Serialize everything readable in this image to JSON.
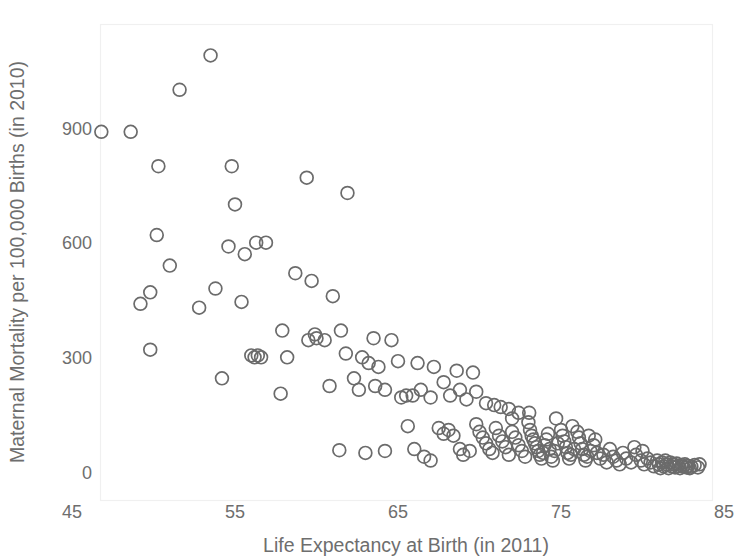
{
  "chart_data": {
    "type": "scatter",
    "title": "",
    "xlabel": "Life Expectancy at Birth (in 2011)",
    "ylabel": "Maternal Mortality per 100,000 Births (in 2010)",
    "xlim": [
      45,
      85
    ],
    "ylim": [
      -40,
      1180
    ],
    "xticks": [
      45,
      55,
      65,
      75,
      85
    ],
    "yticks": [
      0,
      300,
      600,
      900
    ],
    "xticklabels": [
      "45",
      "55",
      "65",
      "75",
      "85"
    ],
    "yticklabels": [
      "0",
      "300",
      "600",
      "900"
    ],
    "grid": false,
    "legend": null,
    "marker": {
      "shape": "open-circle",
      "radius_px": 6.4,
      "stroke": "#6b6b6b",
      "fill": "none",
      "stroke_width": 1.7
    },
    "n_points": 178,
    "points": [
      [
        53.5,
        1090
      ],
      [
        51.6,
        1000
      ],
      [
        46.8,
        890
      ],
      [
        48.6,
        890
      ],
      [
        50.3,
        800
      ],
      [
        54.8,
        800
      ],
      [
        59.4,
        770
      ],
      [
        61.9,
        730
      ],
      [
        55.0,
        700
      ],
      [
        50.2,
        620
      ],
      [
        56.3,
        600
      ],
      [
        56.9,
        600
      ],
      [
        54.6,
        590
      ],
      [
        55.6,
        570
      ],
      [
        51.0,
        540
      ],
      [
        58.7,
        520
      ],
      [
        59.7,
        500
      ],
      [
        49.8,
        470
      ],
      [
        53.8,
        480
      ],
      [
        61.0,
        460
      ],
      [
        49.2,
        440
      ],
      [
        55.4,
        445
      ],
      [
        52.8,
        430
      ],
      [
        57.9,
        370
      ],
      [
        59.9,
        360
      ],
      [
        59.5,
        345
      ],
      [
        60.0,
        350
      ],
      [
        60.5,
        345
      ],
      [
        61.5,
        370
      ],
      [
        63.5,
        350
      ],
      [
        64.6,
        345
      ],
      [
        49.8,
        320
      ],
      [
        56.0,
        305
      ],
      [
        56.4,
        305
      ],
      [
        56.2,
        300
      ],
      [
        56.6,
        300
      ],
      [
        58.2,
        300
      ],
      [
        61.8,
        310
      ],
      [
        62.8,
        300
      ],
      [
        63.2,
        285
      ],
      [
        63.8,
        275
      ],
      [
        65.0,
        290
      ],
      [
        66.2,
        285
      ],
      [
        67.2,
        275
      ],
      [
        68.6,
        265
      ],
      [
        69.6,
        260
      ],
      [
        54.2,
        245
      ],
      [
        57.8,
        205
      ],
      [
        60.8,
        225
      ],
      [
        62.3,
        245
      ],
      [
        62.6,
        215
      ],
      [
        63.6,
        225
      ],
      [
        64.2,
        215
      ],
      [
        65.2,
        195
      ],
      [
        65.5,
        200
      ],
      [
        65.9,
        200
      ],
      [
        66.4,
        215
      ],
      [
        67.0,
        195
      ],
      [
        67.8,
        235
      ],
      [
        68.2,
        200
      ],
      [
        68.8,
        215
      ],
      [
        69.2,
        190
      ],
      [
        69.8,
        210
      ],
      [
        70.4,
        180
      ],
      [
        70.9,
        175
      ],
      [
        71.3,
        170
      ],
      [
        71.8,
        165
      ],
      [
        72.4,
        155
      ],
      [
        72.0,
        140
      ],
      [
        64.2,
        55
      ],
      [
        61.4,
        57
      ],
      [
        63.0,
        50
      ],
      [
        65.6,
        120
      ],
      [
        66.0,
        60
      ],
      [
        66.6,
        40
      ],
      [
        67.0,
        30
      ],
      [
        67.5,
        115
      ],
      [
        67.8,
        100
      ],
      [
        68.1,
        110
      ],
      [
        68.4,
        95
      ],
      [
        68.8,
        60
      ],
      [
        69.0,
        45
      ],
      [
        69.4,
        55
      ],
      [
        69.8,
        125
      ],
      [
        70.0,
        105
      ],
      [
        70.2,
        90
      ],
      [
        70.4,
        75
      ],
      [
        70.6,
        60
      ],
      [
        70.8,
        50
      ],
      [
        71.0,
        115
      ],
      [
        71.2,
        95
      ],
      [
        71.4,
        80
      ],
      [
        71.6,
        65
      ],
      [
        71.8,
        45
      ],
      [
        72.0,
        105
      ],
      [
        72.2,
        90
      ],
      [
        72.4,
        70
      ],
      [
        72.6,
        55
      ],
      [
        72.8,
        40
      ],
      [
        73.0,
        130
      ],
      [
        73.1,
        110
      ],
      [
        73.2,
        95
      ],
      [
        73.3,
        85
      ],
      [
        73.4,
        75
      ],
      [
        73.5,
        65
      ],
      [
        73.6,
        55
      ],
      [
        73.7,
        45
      ],
      [
        73.8,
        35
      ],
      [
        73.9,
        50
      ],
      [
        74.0,
        70
      ],
      [
        74.1,
        85
      ],
      [
        74.2,
        100
      ],
      [
        74.3,
        60
      ],
      [
        74.4,
        40
      ],
      [
        74.5,
        30
      ],
      [
        74.6,
        55
      ],
      [
        74.8,
        75
      ],
      [
        75.0,
        110
      ],
      [
        75.1,
        95
      ],
      [
        75.2,
        80
      ],
      [
        75.3,
        65
      ],
      [
        75.4,
        50
      ],
      [
        75.5,
        35
      ],
      [
        75.6,
        45
      ],
      [
        75.8,
        60
      ],
      [
        76.0,
        105
      ],
      [
        76.1,
        90
      ],
      [
        76.2,
        75
      ],
      [
        76.3,
        60
      ],
      [
        76.4,
        45
      ],
      [
        76.5,
        30
      ],
      [
        76.6,
        40
      ],
      [
        76.8,
        55
      ],
      [
        77.0,
        70
      ],
      [
        77.2,
        50
      ],
      [
        77.4,
        35
      ],
      [
        77.6,
        45
      ],
      [
        77.8,
        25
      ],
      [
        78.0,
        60
      ],
      [
        78.2,
        40
      ],
      [
        78.4,
        30
      ],
      [
        78.6,
        20
      ],
      [
        79.0,
        35
      ],
      [
        79.3,
        25
      ],
      [
        79.6,
        45
      ],
      [
        79.9,
        30
      ],
      [
        80.1,
        20
      ],
      [
        80.3,
        35
      ],
      [
        80.5,
        25
      ],
      [
        80.7,
        15
      ],
      [
        80.9,
        30
      ],
      [
        81.0,
        20
      ],
      [
        81.1,
        10
      ],
      [
        81.2,
        25
      ],
      [
        81.3,
        15
      ],
      [
        81.4,
        30
      ],
      [
        81.5,
        20
      ],
      [
        81.6,
        10
      ],
      [
        81.7,
        25
      ],
      [
        81.8,
        15
      ],
      [
        81.9,
        20
      ],
      [
        82.0,
        12
      ],
      [
        82.1,
        22
      ],
      [
        82.2,
        16
      ],
      [
        82.3,
        10
      ],
      [
        82.4,
        18
      ],
      [
        82.5,
        14
      ],
      [
        82.6,
        20
      ],
      [
        82.7,
        12
      ],
      [
        82.8,
        16
      ],
      [
        82.9,
        10
      ],
      [
        83.0,
        14
      ],
      [
        83.2,
        18
      ],
      [
        83.4,
        12
      ],
      [
        83.5,
        20
      ],
      [
        80.0,
        55
      ],
      [
        79.5,
        65
      ],
      [
        78.8,
        50
      ],
      [
        77.1,
        85
      ],
      [
        76.7,
        95
      ],
      [
        75.7,
        120
      ],
      [
        74.7,
        140
      ],
      [
        73.05,
        155
      ]
    ]
  },
  "axes": {
    "x_axis_name": "life-expectancy-axis",
    "y_axis_name": "maternal-mortality-axis"
  }
}
